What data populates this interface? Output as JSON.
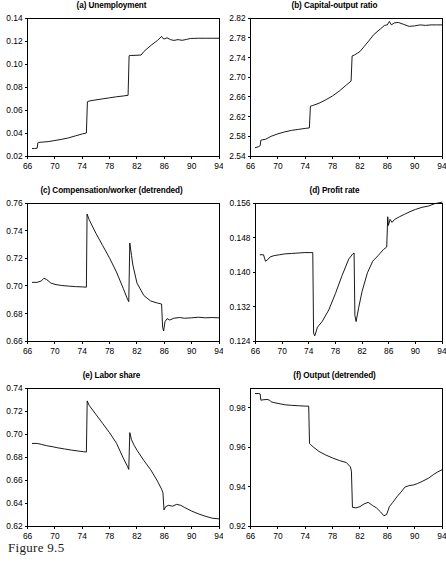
{
  "figure": {
    "caption": "Figure 9.5"
  },
  "chart_data": [
    {
      "id": "panel-a",
      "type": "line",
      "title": "(a) Unemployment",
      "xlabel": "",
      "ylabel": "",
      "xlim": [
        66,
        94
      ],
      "ylim": [
        0.02,
        0.14
      ],
      "xticks": [
        66,
        70,
        74,
        78,
        82,
        86,
        90,
        94
      ],
      "yticks": [
        0.02,
        0.04,
        0.06,
        0.08,
        0.1,
        0.12,
        0.14
      ],
      "ytick_labels": [
        "0.02",
        "0.04",
        "0.06",
        "0.08",
        "0.10",
        "0.12",
        "0.14"
      ],
      "grid": false,
      "legend": "none",
      "series": [
        {
          "name": "unemployment",
          "x": [
            66.7,
            67.0,
            67.4,
            67.5,
            67.6,
            68.0,
            69.0,
            70.0,
            71.0,
            72.0,
            73.0,
            74.0,
            74.6,
            74.75,
            75.0,
            76.0,
            77.0,
            78.0,
            79.0,
            80.0,
            80.7,
            80.85,
            81.0,
            82.0,
            82.6,
            83.0,
            84.0,
            85.0,
            85.6,
            85.8,
            86.0,
            86.4,
            86.9,
            87.4,
            88.0,
            88.6,
            89.2,
            89.8,
            90.4,
            91.0,
            92.0,
            93.0,
            94.0
          ],
          "y": [
            0.0265,
            0.0265,
            0.0268,
            0.0315,
            0.0318,
            0.032,
            0.0325,
            0.0335,
            0.0345,
            0.0358,
            0.0375,
            0.0392,
            0.04,
            0.0672,
            0.0678,
            0.0688,
            0.0697,
            0.0706,
            0.0715,
            0.0722,
            0.0728,
            0.1072,
            0.1074,
            0.1076,
            0.1078,
            0.1108,
            0.116,
            0.1205,
            0.124,
            0.1222,
            0.1218,
            0.1228,
            0.1212,
            0.1205,
            0.1212,
            0.1206,
            0.1213,
            0.1222,
            0.1223,
            0.1224,
            0.1224,
            0.1224,
            0.1224
          ]
        }
      ]
    },
    {
      "id": "panel-b",
      "type": "line",
      "title": "(b) Capital-output ratio",
      "xlabel": "",
      "ylabel": "",
      "xlim": [
        66,
        94
      ],
      "ylim": [
        2.54,
        2.82
      ],
      "xticks": [
        66,
        70,
        74,
        78,
        82,
        86,
        90,
        94
      ],
      "yticks": [
        2.54,
        2.58,
        2.62,
        2.66,
        2.7,
        2.74,
        2.78,
        2.82
      ],
      "ytick_labels": [
        "2.54",
        "2.58",
        "2.62",
        "2.66",
        "2.70",
        "2.74",
        "2.78",
        "2.82"
      ],
      "grid": false,
      "legend": "none",
      "series": [
        {
          "name": "capital-output-ratio",
          "x": [
            66.7,
            67.2,
            67.4,
            67.5,
            67.8,
            68.2,
            69.0,
            70.0,
            71.0,
            72.0,
            73.0,
            74.0,
            74.6,
            74.75,
            75.0,
            76.0,
            77.0,
            78.0,
            79.0,
            80.0,
            80.7,
            80.85,
            81.2,
            82.0,
            82.6,
            83.2,
            84.0,
            85.0,
            85.6,
            86.0,
            86.3,
            86.6,
            87.0,
            87.6,
            88.4,
            89.2,
            90.0,
            90.8,
            91.6,
            92.4,
            93.2,
            94.0
          ],
          "y": [
            2.557,
            2.559,
            2.561,
            2.572,
            2.573,
            2.574,
            2.58,
            2.585,
            2.589,
            2.592,
            2.594,
            2.596,
            2.597,
            2.641,
            2.642,
            2.647,
            2.654,
            2.662,
            2.672,
            2.684,
            2.692,
            2.743,
            2.745,
            2.752,
            2.762,
            2.772,
            2.786,
            2.798,
            2.805,
            2.806,
            2.813,
            2.806,
            2.81,
            2.811,
            2.807,
            2.803,
            2.804,
            2.806,
            2.805,
            2.806,
            2.806,
            2.806
          ]
        }
      ]
    },
    {
      "id": "panel-c",
      "type": "line",
      "title": "(c) Compensation/worker (detrended)",
      "xlabel": "",
      "ylabel": "",
      "xlim": [
        66,
        94
      ],
      "ylim": [
        0.66,
        0.76
      ],
      "xticks": [
        66,
        70,
        74,
        78,
        82,
        86,
        90,
        94
      ],
      "yticks": [
        0.66,
        0.68,
        0.7,
        0.72,
        0.74,
        0.76
      ],
      "ytick_labels": [
        "0.66",
        "0.68",
        "0.70",
        "0.72",
        "0.74",
        "0.76"
      ],
      "grid": false,
      "legend": "none",
      "series": [
        {
          "name": "compensation-per-worker-detrended",
          "x": [
            66.7,
            67.4,
            68.0,
            68.4,
            68.8,
            69.4,
            70.0,
            71.0,
            72.0,
            73.0,
            74.0,
            74.6,
            74.7,
            75.0,
            76.0,
            77.0,
            78.0,
            79.0,
            80.0,
            80.6,
            80.8,
            80.95,
            81.2,
            81.4,
            82.0,
            83.0,
            84.0,
            85.0,
            85.6,
            85.75,
            85.9,
            86.1,
            86.4,
            86.8,
            87.4,
            88.2,
            89.0,
            90.0,
            91.0,
            92.0,
            93.0,
            94.0
          ],
          "y": [
            0.7025,
            0.7025,
            0.7035,
            0.7055,
            0.7045,
            0.702,
            0.701,
            0.7002,
            0.6998,
            0.6994,
            0.6992,
            0.699,
            0.752,
            0.748,
            0.738,
            0.729,
            0.72,
            0.71,
            0.698,
            0.6905,
            0.6885,
            0.731,
            0.722,
            0.715,
            0.702,
            0.693,
            0.689,
            0.6875,
            0.6868,
            0.67,
            0.6672,
            0.674,
            0.6762,
            0.6752,
            0.6765,
            0.677,
            0.6765,
            0.6768,
            0.6772,
            0.6768,
            0.677,
            0.6768
          ]
        }
      ]
    },
    {
      "id": "panel-d",
      "type": "line",
      "title": "(d) Profit rate",
      "xlabel": "",
      "ylabel": "",
      "xlim": [
        66,
        94
      ],
      "ylim": [
        0.124,
        0.156
      ],
      "xticks": [
        66,
        70,
        74,
        78,
        82,
        86,
        90,
        94
      ],
      "yticks": [
        0.124,
        0.132,
        0.14,
        0.148,
        0.156
      ],
      "ytick_labels": [
        "0.124",
        "0.132",
        "0.140",
        "0.148",
        "0.156"
      ],
      "grid": false,
      "legend": "none",
      "series": [
        {
          "name": "profit-rate",
          "x": [
            66.7,
            67.2,
            67.5,
            67.8,
            68.2,
            68.8,
            69.6,
            70.4,
            71.4,
            72.4,
            73.4,
            74.2,
            74.6,
            74.72,
            74.9,
            75.3,
            76.0,
            77.0,
            78.0,
            79.0,
            80.0,
            80.6,
            80.8,
            80.92,
            81.1,
            81.5,
            82.0,
            82.8,
            83.6,
            84.4,
            85.2,
            85.7,
            85.85,
            85.95,
            86.2,
            86.5,
            86.9,
            87.6,
            88.4,
            89.2,
            90.0,
            91.0,
            92.0,
            92.8,
            93.4,
            94.0
          ],
          "y": [
            0.144,
            0.144,
            0.1425,
            0.1428,
            0.1435,
            0.1438,
            0.144,
            0.1442,
            0.1443,
            0.1444,
            0.1445,
            0.1445,
            0.1445,
            0.1258,
            0.1252,
            0.1272,
            0.1285,
            0.1312,
            0.135,
            0.1392,
            0.143,
            0.1442,
            0.1444,
            0.13,
            0.1285,
            0.1318,
            0.1355,
            0.1398,
            0.1425,
            0.1438,
            0.1452,
            0.1458,
            0.1528,
            0.1508,
            0.1522,
            0.1515,
            0.1522,
            0.1528,
            0.1534,
            0.154,
            0.1545,
            0.155,
            0.1553,
            0.1558,
            0.156,
            0.1562
          ]
        }
      ]
    },
    {
      "id": "panel-e",
      "type": "line",
      "title": "(e) Labor share",
      "xlabel": "",
      "ylabel": "",
      "xlim": [
        66,
        94
      ],
      "ylim": [
        0.62,
        0.74
      ],
      "xticks": [
        66,
        70,
        74,
        78,
        82,
        86,
        90,
        94
      ],
      "yticks": [
        0.62,
        0.64,
        0.66,
        0.68,
        0.7,
        0.72,
        0.74
      ],
      "ytick_labels": [
        "0.62",
        "0.64",
        "0.66",
        "0.68",
        "0.70",
        "0.72",
        "0.74"
      ],
      "grid": false,
      "legend": "none",
      "series": [
        {
          "name": "labor-share",
          "x": [
            66.7,
            67.4,
            68.0,
            68.8,
            69.6,
            70.4,
            71.4,
            72.4,
            73.4,
            74.2,
            74.6,
            74.72,
            75.0,
            76.0,
            77.0,
            78.0,
            79.0,
            80.0,
            80.6,
            80.8,
            80.95,
            81.2,
            81.6,
            82.0,
            83.0,
            84.0,
            85.0,
            85.6,
            85.8,
            85.95,
            86.2,
            86.6,
            87.2,
            87.8,
            88.4,
            89.0,
            90.0,
            91.0,
            92.0,
            93.0,
            94.0
          ],
          "y": [
            0.6918,
            0.6918,
            0.691,
            0.6898,
            0.689,
            0.688,
            0.687,
            0.686,
            0.6852,
            0.6846,
            0.6843,
            0.7288,
            0.725,
            0.717,
            0.709,
            0.701,
            0.692,
            0.679,
            0.672,
            0.6692,
            0.7012,
            0.695,
            0.69,
            0.686,
            0.677,
            0.669,
            0.659,
            0.652,
            0.6488,
            0.634,
            0.6368,
            0.638,
            0.6372,
            0.6388,
            0.638,
            0.636,
            0.633,
            0.6305,
            0.6285,
            0.6268,
            0.6262
          ]
        }
      ]
    },
    {
      "id": "panel-f",
      "type": "line",
      "title": "(f) Output (detrended)",
      "xlabel": "",
      "ylabel": "",
      "xlim": [
        66,
        94
      ],
      "ylim": [
        0.92,
        0.99
      ],
      "xticks": [
        66,
        70,
        74,
        78,
        82,
        86,
        90,
        94
      ],
      "yticks": [
        0.92,
        0.94,
        0.96,
        0.98
      ],
      "ytick_labels": [
        "0.92",
        "0.94",
        "0.96",
        "0.98"
      ],
      "grid": false,
      "legend": "none",
      "series": [
        {
          "name": "output-detrended",
          "x": [
            66.7,
            67.2,
            67.4,
            67.5,
            67.8,
            68.4,
            68.8,
            69.0,
            69.4,
            70.0,
            71.0,
            72.0,
            73.0,
            74.0,
            74.5,
            74.62,
            74.8,
            75.2,
            76.0,
            77.0,
            78.0,
            79.0,
            80.0,
            80.6,
            80.75,
            80.9,
            81.4,
            82.0,
            82.6,
            83.2,
            83.8,
            84.4,
            85.0,
            85.5,
            85.9,
            86.3,
            86.8,
            87.4,
            88.0,
            88.6,
            89.2,
            89.8,
            90.4,
            91.2,
            92.0,
            92.8,
            93.4,
            94.0
          ],
          "y": [
            0.9872,
            0.9872,
            0.987,
            0.9838,
            0.984,
            0.9842,
            0.9838,
            0.983,
            0.9826,
            0.9822,
            0.9815,
            0.9812,
            0.981,
            0.9808,
            0.9808,
            0.9618,
            0.9612,
            0.96,
            0.9578,
            0.956,
            0.9545,
            0.9532,
            0.9522,
            0.95,
            0.9478,
            0.9295,
            0.9292,
            0.9298,
            0.9312,
            0.932,
            0.9305,
            0.9292,
            0.9272,
            0.9252,
            0.9258,
            0.9298,
            0.932,
            0.9348,
            0.9372,
            0.9398,
            0.9405,
            0.9408,
            0.9415,
            0.9428,
            0.9442,
            0.9462,
            0.9475,
            0.9485
          ]
        }
      ]
    }
  ]
}
